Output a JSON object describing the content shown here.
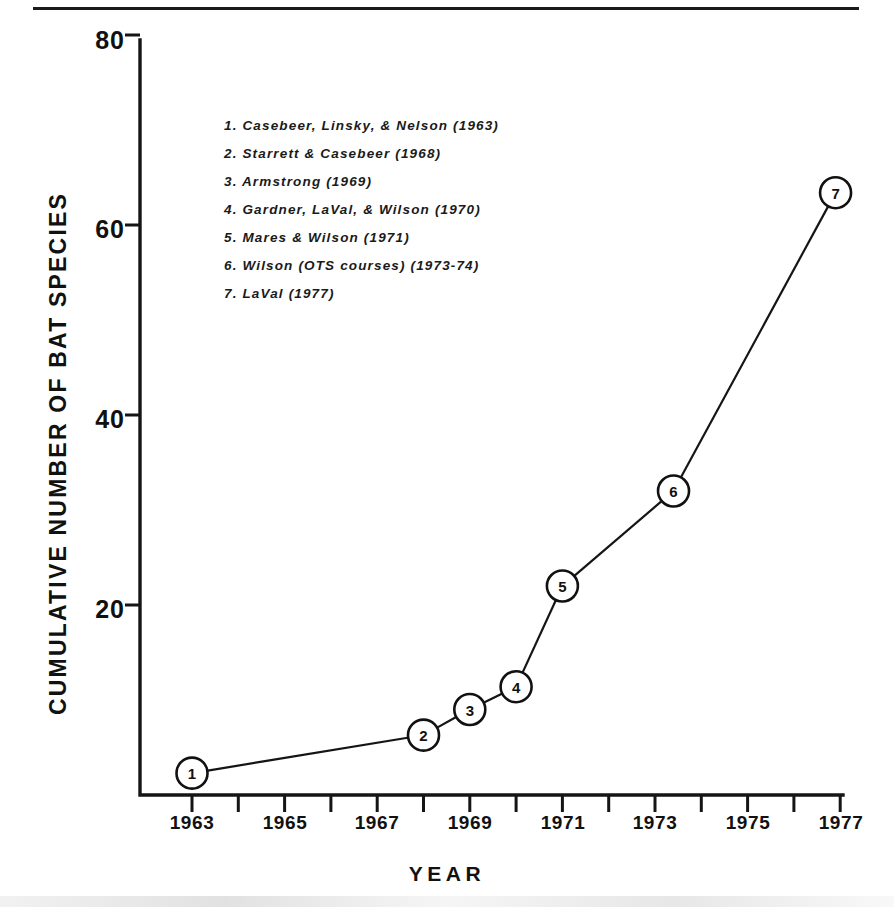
{
  "chart_data": {
    "type": "line",
    "title": "",
    "xlabel": "YEAR",
    "ylabel": "CUMULATIVE NUMBER OF BAT SPECIES",
    "xlim": [
      1962,
      1977
    ],
    "ylim": [
      0,
      80
    ],
    "grid": false,
    "legend_position": "upper-left-inside",
    "x_ticks_all": [
      1963,
      1964,
      1965,
      1966,
      1967,
      1968,
      1969,
      1970,
      1971,
      1972,
      1973,
      1974,
      1975,
      1976,
      1977
    ],
    "x_tick_labels": [
      "1963",
      "1965",
      "1967",
      "1969",
      "1971",
      "1973",
      "1975",
      "1977"
    ],
    "x_tick_label_values": [
      1963,
      1965,
      1967,
      1969,
      1971,
      1973,
      1975,
      1977
    ],
    "y_ticks": [
      20,
      40,
      60,
      80
    ],
    "y_tick_labels": [
      "20",
      "40",
      "60",
      "80"
    ],
    "points": [
      {
        "label": "1",
        "x": 1963.0,
        "y": 2.3
      },
      {
        "label": "2",
        "x": 1968.0,
        "y": 6.3
      },
      {
        "label": "3",
        "x": 1969.0,
        "y": 9.0
      },
      {
        "label": "4",
        "x": 1970.0,
        "y": 11.4
      },
      {
        "label": "5",
        "x": 1971.0,
        "y": 22.0
      },
      {
        "label": "6",
        "x": 1973.4,
        "y": 32.0
      },
      {
        "label": "7",
        "x": 1976.9,
        "y": 63.4
      }
    ],
    "annotations": [
      "1. Casebeer, Linsky, & Nelson  (1963)",
      "2. Starrett & Casebeer  (1968)",
      "3. Armstrong  (1969)",
      "4. Gardner, LaVal, & Wilson  (1970)",
      "5. Mares & Wilson  (1971)",
      "6. Wilson (OTS courses) (1973-74)",
      "7. LaVal (1977)"
    ]
  },
  "legend": {
    "items": [
      "1. Casebeer, Linsky, & Nelson  (1963)",
      "2. Starrett & Casebeer  (1968)",
      "3. Armstrong  (1969)",
      "4. Gardner, LaVal, & Wilson  (1970)",
      "5. Mares & Wilson  (1971)",
      "6. Wilson (OTS courses) (1973-74)",
      "7. LaVal (1977)"
    ]
  },
  "axes": {
    "y_title": "CUMULATIVE NUMBER OF BAT SPECIES",
    "x_title": "YEAR",
    "y_tick_labels": [
      "80",
      "60",
      "40",
      "20"
    ],
    "x_tick_labels": [
      "1963",
      "1965",
      "1967",
      "1969",
      "1971",
      "1973",
      "1975",
      "1977"
    ]
  },
  "colors": {
    "ink": "#151515",
    "background": "#ffffff"
  }
}
